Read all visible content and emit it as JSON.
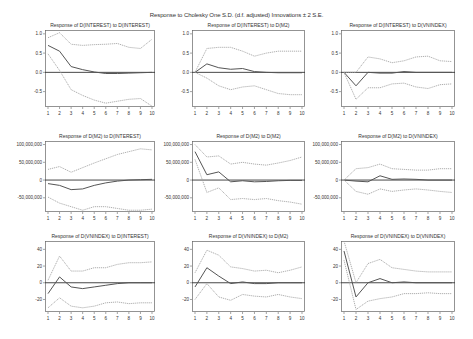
{
  "title": "Response to Cholesky One S.D. (d.f. adjusted) Innovations ± 2 S.E.",
  "colors": {
    "response": "#555555",
    "bands": "#9a9a9a",
    "zero": "#333333",
    "frame": "#666666"
  },
  "chart_data": [
    {
      "type": "line",
      "title": "Response of D(INTEREST) to D(INTEREST)",
      "x": [
        1,
        2,
        3,
        4,
        5,
        6,
        7,
        8,
        9,
        10
      ],
      "ylim": [
        -0.9,
        1.1
      ],
      "yticks": [
        1.0,
        0.5,
        0.0,
        -0.5
      ],
      "ytick_labels": [
        "1.0",
        "0.5",
        "0.0",
        "-0.5"
      ],
      "series": [
        {
          "name": "Response",
          "values": [
            0.7,
            0.55,
            0.15,
            0.07,
            0.01,
            -0.03,
            -0.03,
            -0.02,
            -0.01,
            0.0
          ]
        },
        {
          "name": "+2 S.E.",
          "values": [
            0.9,
            1.03,
            0.73,
            0.7,
            0.72,
            0.73,
            0.75,
            0.65,
            0.62,
            0.86
          ]
        },
        {
          "name": "-2 S.E.",
          "values": [
            0.48,
            0.05,
            -0.45,
            -0.6,
            -0.72,
            -0.8,
            -0.75,
            -0.7,
            -0.68,
            -0.88
          ]
        }
      ]
    },
    {
      "type": "line",
      "title": "Response of D(INTEREST) to D(M2)",
      "x": [
        1,
        2,
        3,
        4,
        5,
        6,
        7,
        8,
        9,
        10
      ],
      "ylim": [
        -0.9,
        1.1
      ],
      "yticks": [
        1.0,
        0.5,
        0.0,
        -0.5
      ],
      "ytick_labels": [
        "1.0",
        "0.5",
        "0.0",
        "-0.5"
      ],
      "series": [
        {
          "name": "Response",
          "values": [
            0.0,
            0.22,
            0.12,
            0.08,
            0.1,
            0.02,
            0.0,
            -0.01,
            -0.01,
            -0.01
          ]
        },
        {
          "name": "+2 S.E.",
          "values": [
            0.0,
            0.62,
            0.65,
            0.65,
            0.55,
            0.42,
            0.5,
            0.55,
            0.55,
            0.55
          ]
        },
        {
          "name": "-2 S.E.",
          "values": [
            0.0,
            -0.15,
            -0.35,
            -0.45,
            -0.38,
            -0.35,
            -0.45,
            -0.55,
            -0.58,
            -0.58
          ]
        }
      ]
    },
    {
      "type": "line",
      "title": "Response of D(INTEREST) to D(VNINDEX)",
      "x": [
        1,
        2,
        3,
        4,
        5,
        6,
        7,
        8,
        9,
        10
      ],
      "ylim": [
        -0.9,
        1.1
      ],
      "yticks": [
        1.0,
        0.5,
        0.0,
        -0.5
      ],
      "ytick_labels": [
        "1.0",
        "0.5",
        "0.0",
        "-0.5"
      ],
      "series": [
        {
          "name": "Response",
          "values": [
            0.0,
            -0.35,
            0.0,
            -0.02,
            -0.02,
            0.02,
            0.0,
            0.0,
            0.0,
            0.0
          ]
        },
        {
          "name": "+2 S.E.",
          "values": [
            0.0,
            0.0,
            0.4,
            0.35,
            0.25,
            0.3,
            0.4,
            0.42,
            0.3,
            0.28
          ]
        },
        {
          "name": "-2 S.E.",
          "values": [
            0.0,
            -0.7,
            -0.4,
            -0.4,
            -0.3,
            -0.28,
            -0.38,
            -0.42,
            -0.32,
            -0.3
          ]
        }
      ]
    },
    {
      "type": "line",
      "title": "Response of D(M2) to D(INTEREST)",
      "x": [
        1,
        2,
        3,
        4,
        5,
        6,
        7,
        8,
        9,
        10
      ],
      "ylim": [
        -90000000,
        110000000
      ],
      "yticks": [
        100000000,
        50000000,
        0,
        -50000000
      ],
      "ytick_labels": [
        "100,000,000",
        "50,000,000",
        "0",
        "-50,000,000"
      ],
      "series": [
        {
          "name": "Response",
          "values": [
            -10000000,
            -15000000,
            -27000000,
            -25000000,
            -15000000,
            -8000000,
            -3000000,
            0,
            1000000,
            2000000
          ]
        },
        {
          "name": "+2 S.E.",
          "values": [
            30000000,
            38000000,
            22000000,
            35000000,
            48000000,
            60000000,
            72000000,
            80000000,
            88000000,
            85000000
          ]
        },
        {
          "name": "-2 S.E.",
          "values": [
            -48000000,
            -65000000,
            -75000000,
            -85000000,
            -75000000,
            -75000000,
            -80000000,
            -85000000,
            -85000000,
            -82000000
          ]
        }
      ]
    },
    {
      "type": "line",
      "title": "Response of D(M2) to D(M2)",
      "x": [
        1,
        2,
        3,
        4,
        5,
        6,
        7,
        8,
        9,
        10
      ],
      "ylim": [
        -90000000,
        110000000
      ],
      "yticks": [
        100000000,
        50000000,
        0,
        -50000000
      ],
      "ytick_labels": [
        "100,000,000",
        "50,000,000",
        "0",
        "-50,000,000"
      ],
      "series": [
        {
          "name": "Response",
          "values": [
            80000000,
            15000000,
            23000000,
            -5000000,
            -2000000,
            -5000000,
            -4000000,
            -2000000,
            -1000000,
            -1000000
          ]
        },
        {
          "name": "+2 S.E.",
          "values": [
            100000000,
            65000000,
            68000000,
            45000000,
            50000000,
            45000000,
            42000000,
            48000000,
            55000000,
            65000000
          ]
        },
        {
          "name": "-2 S.E.",
          "values": [
            58000000,
            -35000000,
            -22000000,
            -55000000,
            -52000000,
            -55000000,
            -52000000,
            -58000000,
            -62000000,
            -68000000
          ]
        }
      ]
    },
    {
      "type": "line",
      "title": "Response of D(M2) to D(VNINDEX)",
      "x": [
        1,
        2,
        3,
        4,
        5,
        6,
        7,
        8,
        9,
        10
      ],
      "ylim": [
        -90000000,
        110000000
      ],
      "yticks": [
        100000000,
        50000000,
        0,
        -50000000
      ],
      "ytick_labels": [
        "100,000,000",
        "50,000,000",
        "0",
        "-50,000,000"
      ],
      "series": [
        {
          "name": "Response",
          "values": [
            0,
            -3000000,
            -5000000,
            12000000,
            2000000,
            3000000,
            2000000,
            0,
            0,
            0
          ]
        },
        {
          "name": "+2 S.E.",
          "values": [
            0,
            32000000,
            35000000,
            45000000,
            32000000,
            30000000,
            28000000,
            28000000,
            32000000,
            32000000
          ]
        },
        {
          "name": "-2 S.E.",
          "values": [
            0,
            -32000000,
            -40000000,
            -25000000,
            -32000000,
            -28000000,
            -25000000,
            -28000000,
            -32000000,
            -35000000
          ]
        }
      ]
    },
    {
      "type": "line",
      "title": "Response of D(VNINDEX) to D(INTEREST)",
      "x": [
        1,
        2,
        3,
        4,
        5,
        6,
        7,
        8,
        9,
        10
      ],
      "ylim": [
        -35,
        50
      ],
      "yticks": [
        40,
        20,
        0,
        -20
      ],
      "ytick_labels": [
        "40",
        "20",
        "0",
        "-20"
      ],
      "series": [
        {
          "name": "Response",
          "values": [
            -13,
            7,
            -5,
            -7,
            -5,
            -3,
            -1,
            0,
            0,
            0
          ]
        },
        {
          "name": "+2 S.E.",
          "values": [
            3,
            32,
            14,
            14,
            18,
            18,
            22,
            24,
            24,
            25
          ]
        },
        {
          "name": "-2 S.E.",
          "values": [
            -30,
            -18,
            -28,
            -30,
            -28,
            -24,
            -23,
            -25,
            -24,
            -24
          ]
        }
      ]
    },
    {
      "type": "line",
      "title": "Response of D(VNINDEX) to D(M2)",
      "x": [
        1,
        2,
        3,
        4,
        5,
        6,
        7,
        8,
        9,
        10
      ],
      "ylim": [
        -35,
        50
      ],
      "yticks": [
        40,
        20,
        0,
        -20
      ],
      "ytick_labels": [
        "40",
        "20",
        "0",
        "-20"
      ],
      "series": [
        {
          "name": "Response",
          "values": [
            -5,
            18,
            8,
            -1,
            1,
            -1,
            -1,
            0,
            0,
            0
          ]
        },
        {
          "name": "+2 S.E.",
          "values": [
            12,
            39,
            33,
            19,
            17,
            14,
            15,
            12,
            15,
            19
          ]
        },
        {
          "name": "-2 S.E.",
          "values": [
            -20,
            -1,
            -17,
            -21,
            -14,
            -16,
            -17,
            -14,
            -17,
            -19
          ]
        }
      ]
    },
    {
      "type": "line",
      "title": "Response of D(VNINDEX) to D(VNINDEX)",
      "x": [
        1,
        2,
        3,
        4,
        5,
        6,
        7,
        8,
        9,
        10
      ],
      "ylim": [
        -35,
        50
      ],
      "yticks": [
        40,
        20,
        0,
        -20
      ],
      "ytick_labels": [
        "40",
        "20",
        "0",
        "-20"
      ],
      "series": [
        {
          "name": "Response",
          "values": [
            38,
            -17,
            0,
            5,
            0,
            1,
            0,
            0,
            0,
            0
          ]
        },
        {
          "name": "+2 S.E.",
          "values": [
            50,
            0,
            23,
            28,
            18,
            16,
            14,
            13,
            13,
            13
          ]
        },
        {
          "name": "-2 S.E.",
          "values": [
            27,
            -32,
            -22,
            -19,
            -17,
            -13,
            -13,
            -12,
            -13,
            -13
          ]
        }
      ]
    }
  ]
}
